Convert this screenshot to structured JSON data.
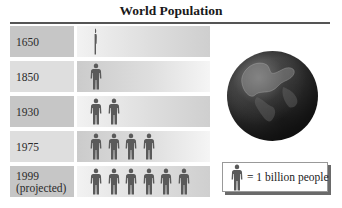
{
  "chart_data": {
    "type": "pictogram",
    "title": "World Population",
    "unit": "1 billion people per figure",
    "categories": [
      "1650",
      "1850",
      "1930",
      "1975",
      "1999 (projected)"
    ],
    "values": [
      0.5,
      1,
      2,
      4,
      6
    ],
    "legend": "= 1 billion people",
    "figure_color": "#5a5a5a"
  },
  "title": "World Population",
  "rows": [
    {
      "label": "1650",
      "sublabel": "",
      "count": 0.5
    },
    {
      "label": "1850",
      "sublabel": "",
      "count": 1
    },
    {
      "label": "1930",
      "sublabel": "",
      "count": 2
    },
    {
      "label": "1975",
      "sublabel": "",
      "count": 4
    },
    {
      "label": "1999",
      "sublabel": "(projected)",
      "count": 6
    }
  ],
  "legend": {
    "text": "= 1 billion people",
    "icon": "person-icon"
  },
  "image": {
    "globe": "earth-globe"
  }
}
